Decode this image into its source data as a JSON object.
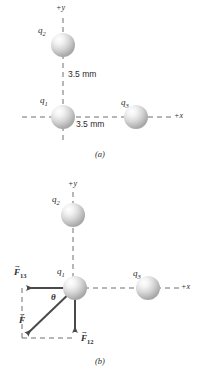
{
  "figure": {
    "type": "physics-force-diagram",
    "background_color": "#ffffff",
    "ink_color": "#2b2b2b",
    "sphere_color": "#b9b9b9",
    "panels": [
      {
        "id": "a",
        "caption": "(a)",
        "caption_pos": {
          "x": 100,
          "y": 155
        },
        "axes": [
          {
            "name": "+y",
            "label": "+y",
            "pos": {
              "x": 62,
              "y": 8
            }
          },
          {
            "name": "+x",
            "label": "+x",
            "pos": {
              "x": 178,
              "y": 117
            }
          }
        ],
        "charges": [
          {
            "name": "q2",
            "label": "q",
            "sub": "2",
            "cx": 63,
            "cy": 45,
            "r": 12,
            "label_pos": {
              "x": 42,
              "y": 31
            }
          },
          {
            "name": "q1",
            "label": "q",
            "sub": "1",
            "cx": 63,
            "cy": 117,
            "r": 12,
            "label_pos": {
              "x": 44,
              "y": 101
            }
          },
          {
            "name": "q3",
            "label": "q",
            "sub": "3",
            "cx": 136,
            "cy": 117,
            "r": 12,
            "label_pos": {
              "x": 124,
              "y": 103
            }
          }
        ],
        "distances": [
          {
            "name": "q1-q2-separation",
            "text": "3.5 mm",
            "pos": {
              "x": 68,
              "y": 74
            }
          },
          {
            "name": "q1-q3-separation",
            "text": "3.5 mm",
            "pos": {
              "x": 76,
              "y": 124
            }
          }
        ]
      },
      {
        "id": "b",
        "caption": "(b)",
        "caption_pos": {
          "x": 100,
          "y": 362
        },
        "axes": [
          {
            "name": "+y",
            "label": "+y",
            "pos": {
              "x": 74,
              "y": 184
            }
          },
          {
            "name": "+x",
            "label": "+x",
            "pos": {
              "x": 184,
              "y": 288
            }
          }
        ],
        "charges": [
          {
            "name": "q2",
            "label": "q",
            "sub": "2",
            "cx": 73,
            "cy": 215,
            "r": 12,
            "label_pos": {
              "x": 55,
              "y": 200
            }
          },
          {
            "name": "q1",
            "label": "q",
            "sub": "1",
            "cx": 75,
            "cy": 288,
            "r": 12,
            "label_pos": {
              "x": 60,
              "y": 272
            }
          },
          {
            "name": "q3",
            "label": "q",
            "sub": "3",
            "cx": 148,
            "cy": 288,
            "r": 12,
            "label_pos": {
              "x": 136,
              "y": 274
            }
          }
        ],
        "vectors": [
          {
            "name": "F13",
            "label": "F",
            "sub": "13",
            "from": {
              "x": 75,
              "y": 288
            },
            "to": {
              "x": 22,
              "y": 288
            },
            "label_pos": {
              "x": 16,
              "y": 268
            }
          },
          {
            "name": "F12",
            "label": "F",
            "sub": "12",
            "from": {
              "x": 75,
              "y": 288
            },
            "to": {
              "x": 75,
              "y": 337
            },
            "label_pos": {
              "x": 82,
              "y": 336
            }
          },
          {
            "name": "F-resultant",
            "label": "F",
            "sub": "",
            "from": {
              "x": 75,
              "y": 288
            },
            "to": {
              "x": 23,
              "y": 338
            },
            "label_pos": {
              "x": 21,
              "y": 318
            }
          }
        ],
        "angle": {
          "name": "theta",
          "label": "θ",
          "pos": {
            "x": 53,
            "y": 291
          }
        }
      }
    ]
  }
}
